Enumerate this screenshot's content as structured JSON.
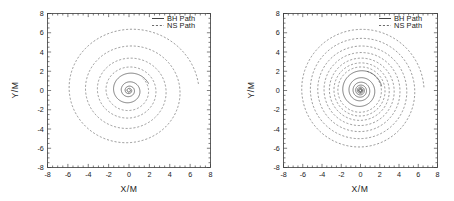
{
  "figure": {
    "background": "#ffffff",
    "panel_count": 2
  },
  "chart_data": [
    {
      "type": "line",
      "title": "",
      "panel_index": 0,
      "xlabel": "X/M",
      "ylabel": "Y/M",
      "xlim": [
        -8,
        8
      ],
      "ylim": [
        -8,
        8
      ],
      "xticks": [
        -8,
        -6,
        -4,
        -2,
        0,
        2,
        4,
        6,
        8
      ],
      "yticks": [
        -8,
        -6,
        -4,
        -2,
        0,
        2,
        4,
        6,
        8
      ],
      "xticklabels": [
        "-8",
        "-6",
        "-4",
        "-2",
        "0",
        "2",
        "4",
        "6",
        "8"
      ],
      "yticklabels": [
        "-8",
        "-6",
        "-4",
        "-2",
        "0",
        "2",
        "4",
        "6",
        "8"
      ],
      "grid": false,
      "minor_ticks": true,
      "legend_position": "top-right",
      "series": [
        {
          "name": "BH Path",
          "style": "solid",
          "color": "#2e2e2e",
          "spiral": {
            "r_start": 2.05,
            "r_end": 0.12,
            "theta_start": 0.35,
            "turns": 4.1,
            "decay": "exponential"
          }
        },
        {
          "name": "NS Path",
          "style": "dashed",
          "color": "#5c5c5c",
          "spiral": {
            "r_start": 6.85,
            "r_end": 1.85,
            "theta_start": 0.1,
            "turns": 4.1,
            "decay": "exponential"
          }
        }
      ]
    },
    {
      "type": "line",
      "title": "",
      "panel_index": 1,
      "xlabel": "X/M",
      "ylabel": "Y/M",
      "xlim": [
        -8,
        8
      ],
      "ylim": [
        -8,
        8
      ],
      "xticks": [
        -8,
        -6,
        -4,
        -2,
        0,
        2,
        4,
        6,
        8
      ],
      "yticks": [
        -8,
        -6,
        -4,
        -2,
        0,
        2,
        4,
        6,
        8
      ],
      "xticklabels": [
        "-8",
        "-6",
        "-4",
        "-2",
        "0",
        "2",
        "4",
        "6",
        "8"
      ],
      "yticklabels": [
        "-8",
        "-6",
        "-4",
        "-2",
        "0",
        "2",
        "4",
        "6",
        "8"
      ],
      "grid": false,
      "minor_ticks": true,
      "legend_position": "top-right",
      "series": [
        {
          "name": "BH Path",
          "style": "solid",
          "color": "#2e2e2e",
          "spiral": {
            "r_start": 2.25,
            "r_end": 0.1,
            "theta_start": 0.2,
            "turns": 7.2,
            "decay": "exponential"
          }
        },
        {
          "name": "NS Path",
          "style": "dashed",
          "color": "#5c5c5c",
          "spiral": {
            "r_start": 6.6,
            "r_end": 2.1,
            "theta_start": 0.05,
            "turns": 7.2,
            "decay": "exponential"
          }
        }
      ]
    }
  ],
  "panels": [
    {
      "id": "left-panel",
      "xlabel": "X/M",
      "ylabel": "Y/M",
      "legend": [
        {
          "label": "BH Path",
          "style": "solid"
        },
        {
          "label": "NS Path",
          "style": "dashed"
        }
      ]
    },
    {
      "id": "right-panel",
      "xlabel": "X/M",
      "ylabel": "Y/M",
      "legend": [
        {
          "label": "BH Path",
          "style": "solid"
        },
        {
          "label": "NS Path",
          "style": "dashed"
        }
      ]
    }
  ]
}
